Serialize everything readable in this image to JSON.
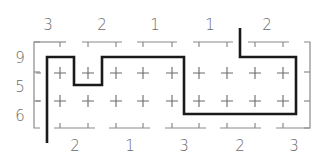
{
  "puzzle": {
    "type": "path-puzzle-diagram",
    "top_clues": [
      "3",
      "2",
      "1",
      "1",
      "2"
    ],
    "bottom_clues": [
      "2",
      "1",
      "3",
      "2",
      "3"
    ],
    "left_clues": [
      "9",
      "5",
      "6"
    ],
    "grid": {
      "rows": 3,
      "cols": 9
    },
    "colors": {
      "path": "#1a1a1a",
      "marks": "#6a6a6a",
      "brackets": "#8a8a8a",
      "background": "#ffffff"
    }
  }
}
